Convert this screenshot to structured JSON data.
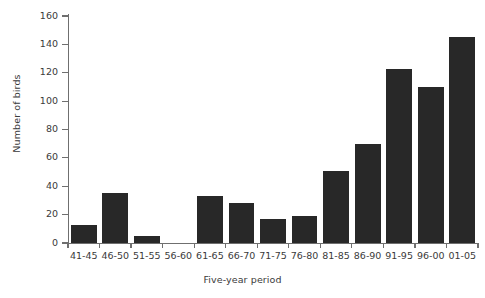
{
  "chart_data": {
    "type": "bar",
    "title": "",
    "subtitle": "",
    "xlabel": "Five-year period",
    "ylabel": "Number of birds",
    "categories": [
      "41-45",
      "46-50",
      "51-55",
      "56-60",
      "61-65",
      "66-70",
      "71-75",
      "76-80",
      "81-85",
      "86-90",
      "91-95",
      "96-00",
      "01-05"
    ],
    "values": [
      13,
      35,
      5,
      0,
      33,
      28,
      17,
      19,
      51,
      70,
      123,
      110,
      145
    ],
    "ylim": [
      0,
      160
    ],
    "yticks": [
      0,
      20,
      40,
      60,
      80,
      100,
      120,
      140,
      160
    ],
    "ytick_labels": [
      "0",
      "20",
      "40",
      "60",
      "80",
      "100",
      "120",
      "140",
      "160"
    ],
    "grid": false,
    "legend": null,
    "bar_color": "#282828",
    "axis_color": "#6f6f6f",
    "text_color": "#3a3a3a",
    "background": "#ffffff"
  }
}
